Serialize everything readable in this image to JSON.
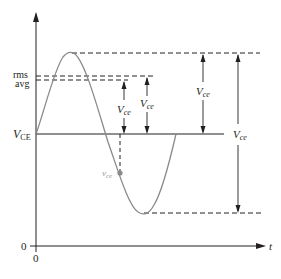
{
  "figure": {
    "type": "waveform-diagram"
  },
  "colors": {
    "axis": "#231f20",
    "curve": "#8a8a8a",
    "dashed": "#231f20",
    "instantaneous_label": "#9a9a9a"
  },
  "axes": {
    "y_axis": {
      "arrow": true
    },
    "x_axis": {
      "label": "t",
      "arrow": true
    },
    "origin_x_label": "0",
    "origin_y_label": "0"
  },
  "levels": {
    "rms_label": "rms",
    "avg_label": "avg",
    "dc_label_main": "V",
    "dc_label_sub": "CE"
  },
  "annotations": {
    "vce_main": "V",
    "vce_sub": "ce",
    "instantaneous_main": "v",
    "instantaneous_sub": "ce"
  },
  "markers": [
    {
      "id": "avg-to-dc",
      "label_main": "V",
      "label_sub": "ce",
      "from": "avg",
      "to": "dc"
    },
    {
      "id": "rms-to-dc",
      "label_main": "V",
      "label_sub": "ce",
      "from": "rms",
      "to": "dc"
    },
    {
      "id": "peak-to-dc",
      "label_main": "V",
      "label_sub": "ce",
      "from": "peak",
      "to": "dc"
    },
    {
      "id": "peak-to-peak",
      "label_main": "V",
      "label_sub": "ce",
      "from": "peak",
      "to": "trough"
    }
  ]
}
